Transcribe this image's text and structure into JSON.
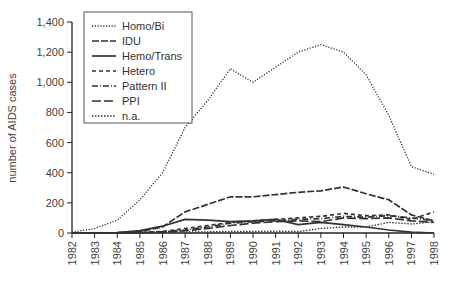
{
  "chart_data": {
    "type": "line",
    "title": "",
    "xlabel": "",
    "ylabel": "number of AIDS cases",
    "ylim": [
      0,
      1400
    ],
    "yticks": [
      0,
      200,
      400,
      600,
      800,
      1000,
      1200,
      1400
    ],
    "ytick_labels": [
      "0",
      "200",
      "400",
      "600",
      "800",
      "1,000",
      "1,200",
      "1,400"
    ],
    "categories": [
      "1982",
      "1983",
      "1984",
      "1985",
      "1986",
      "1987",
      "1988",
      "1989",
      "1990",
      "1991",
      "1992",
      "1993",
      "1994",
      "1995",
      "1996",
      "1997",
      "1998"
    ],
    "grid": false,
    "legend_position": "upper left",
    "series": [
      {
        "name": "Homo/Bi",
        "style": "dotted",
        "values": [
          5,
          30,
          85,
          220,
          400,
          700,
          880,
          1090,
          1000,
          1100,
          1200,
          1250,
          1200,
          1050,
          780,
          440,
          390
        ]
      },
      {
        "name": "IDU",
        "style": "long-dash",
        "values": [
          0,
          0,
          2,
          10,
          40,
          140,
          190,
          240,
          240,
          255,
          270,
          280,
          305,
          260,
          220,
          120,
          80
        ]
      },
      {
        "name": "Hemo/Trans",
        "style": "solid",
        "values": [
          0,
          0,
          2,
          15,
          45,
          90,
          85,
          75,
          80,
          90,
          55,
          70,
          55,
          40,
          20,
          5,
          0
        ]
      },
      {
        "name": "Hetero",
        "style": "dashed",
        "values": [
          0,
          0,
          0,
          3,
          10,
          30,
          50,
          70,
          80,
          90,
          100,
          110,
          130,
          115,
          120,
          90,
          140
        ]
      },
      {
        "name": "Pattern II",
        "style": "dash-dot",
        "values": [
          0,
          0,
          0,
          2,
          8,
          20,
          40,
          65,
          75,
          80,
          90,
          95,
          110,
          105,
          115,
          100,
          80
        ]
      },
      {
        "name": "PPI",
        "style": "dash",
        "values": [
          0,
          0,
          0,
          2,
          5,
          15,
          30,
          50,
          65,
          75,
          80,
          75,
          100,
          95,
          100,
          80,
          70
        ]
      },
      {
        "name": "n.a.",
        "style": "fine-dotted",
        "values": [
          0,
          0,
          1,
          3,
          5,
          8,
          8,
          10,
          10,
          12,
          10,
          30,
          40,
          40,
          70,
          60,
          75
        ]
      }
    ]
  },
  "legend": {
    "items": [
      {
        "label": "Homo/Bi"
      },
      {
        "label": "IDU"
      },
      {
        "label": "Hemo/Trans"
      },
      {
        "label": "Hetero"
      },
      {
        "label": "Pattern II"
      },
      {
        "label": "PPI"
      },
      {
        "label": "n.a."
      }
    ]
  },
  "colors": {
    "line": "#333333",
    "axis": "#222222",
    "background": "#ffffff"
  }
}
